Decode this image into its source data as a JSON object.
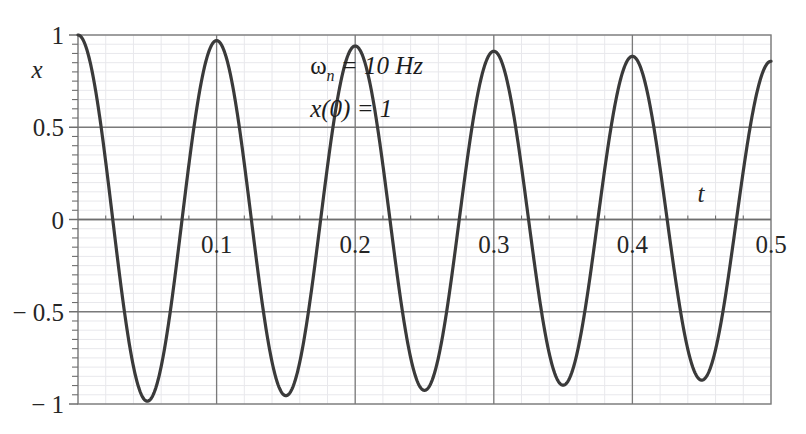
{
  "chart_data": {
    "type": "line",
    "title": "",
    "subtitle": "",
    "xlabel": "t",
    "ylabel": "x",
    "xlim": [
      0,
      0.5
    ],
    "ylim": [
      -1,
      1
    ],
    "grid": true,
    "legend": null,
    "x_ticks": [
      {
        "value": 0.0,
        "label": ""
      },
      {
        "value": 0.1,
        "label": "0.1"
      },
      {
        "value": 0.2,
        "label": "0.2"
      },
      {
        "value": 0.3,
        "label": "0.3"
      },
      {
        "value": 0.4,
        "label": "0.4"
      },
      {
        "value": 0.5,
        "label": "0.5"
      }
    ],
    "y_ticks": [
      {
        "value": 1.0,
        "label": "1"
      },
      {
        "value": 0.5,
        "label": "0.5"
      },
      {
        "value": 0.0,
        "label": "0"
      },
      {
        "value": -0.5,
        "label": "− 0.5"
      },
      {
        "value": -1.0,
        "label": "− 1"
      }
    ],
    "x_minor_step": 0.02,
    "y_minor_step": 0.05,
    "annotations": [
      {
        "id": "omega-n",
        "base": "ω",
        "sub": "n",
        "rest": " = 10 Hz",
        "x": 0.335,
        "y": 0.79
      },
      {
        "id": "x-zero",
        "base": "x",
        "sub": "",
        "rest": "(0) = 1",
        "x": 0.335,
        "y": 0.555
      }
    ],
    "series": [
      {
        "name": "damped free vibration",
        "color": "#3a3a3a",
        "linewidth": 3.2,
        "equation": "x(t) = exp(-zeta*wn*t) * cos(wd*t)",
        "zeta": 0.00489,
        "wn_hz": 10,
        "period": 0.1,
        "decay_ratio_per_period": 0.7353,
        "key_points": [
          {
            "t": 0.0,
            "x": 1.0
          },
          {
            "t": 0.025,
            "x": 0.0
          },
          {
            "t": 0.047,
            "x": -0.845
          },
          {
            "t": 0.075,
            "x": 0.0
          },
          {
            "t": 0.1,
            "x": 0.74
          },
          {
            "t": 0.125,
            "x": 0.0
          },
          {
            "t": 0.148,
            "x": -0.615
          },
          {
            "t": 0.175,
            "x": 0.0
          },
          {
            "t": 0.2,
            "x": 0.54
          },
          {
            "t": 0.225,
            "x": 0.0
          },
          {
            "t": 0.249,
            "x": -0.45
          },
          {
            "t": 0.275,
            "x": 0.0
          },
          {
            "t": 0.3,
            "x": 0.395
          },
          {
            "t": 0.325,
            "x": 0.0
          },
          {
            "t": 0.35,
            "x": -0.33
          },
          {
            "t": 0.375,
            "x": 0.0
          },
          {
            "t": 0.4,
            "x": 0.29
          },
          {
            "t": 0.425,
            "x": 0.0
          },
          {
            "t": 0.451,
            "x": -0.243
          },
          {
            "t": 0.475,
            "x": 0.0
          },
          {
            "t": 0.5,
            "x": 0.213
          }
        ]
      }
    ]
  },
  "style": {
    "axis_color": "#6e6e6e",
    "major_grid_color": "#7a7a7a",
    "minor_grid_color": "#e8e8ec",
    "frame_color": "#7a7a7a",
    "curve_color": "#3a3a3a",
    "background": "#ffffff",
    "text_color": "#262626"
  },
  "plot_box": {
    "left": 78,
    "top": 35,
    "right": 771,
    "bottom": 404
  }
}
